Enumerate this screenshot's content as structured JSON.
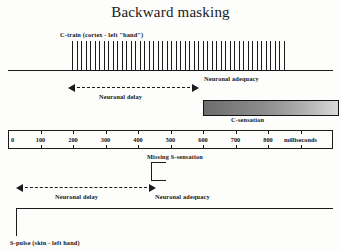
{
  "figure": {
    "title": "Backward masking",
    "width": 341,
    "height": 251,
    "background": "#fdfdfc",
    "ink": "#1b1b1b"
  },
  "labels": {
    "c_train": "C-train (cortex - left \"hand\")",
    "neuronal_adequacy_top": "Neuronal adequacy",
    "neuronal_delay_top": "Neuronal delay",
    "c_sensation": "C-sensation",
    "missing_s_sensation": "Missing S-sensation",
    "neuronal_delay_bottom": "Neuronal delay",
    "neuronal_adequacy_bottom": "Neuronal adequacy",
    "s_pulse": "S-pulse (skin - left hand)"
  },
  "axis": {
    "unit_label": "milliseconds",
    "ticks": [
      "0",
      "100",
      "200",
      "300",
      "400",
      "500",
      "600",
      "700",
      "800"
    ],
    "tick_values": [
      0,
      100,
      200,
      300,
      400,
      500,
      600,
      700,
      800
    ],
    "range_ms": [
      0,
      1000
    ],
    "unit_label_at_ms": 900,
    "minor_tick_count": 11
  },
  "chart_data": {
    "type": "timeline",
    "title": "Backward masking",
    "xlabel": "milliseconds",
    "xlim": [
      0,
      1000
    ],
    "xticks": [
      0,
      100,
      200,
      300,
      400,
      500,
      600,
      700,
      800
    ],
    "grid": false,
    "legend": "none",
    "series": [
      {
        "name": "C-train (cortex - left \"hand\")",
        "type": "pulse-train",
        "row": "top",
        "start_ms": 215,
        "end_ms": 915,
        "pulse_count": 48,
        "baseline_from_ms": -20,
        "baseline_to_ms": 1010
      },
      {
        "name": "Neuronal delay (cortical)",
        "type": "double-arrow",
        "row": "top",
        "start_ms": 200,
        "end_ms": 625
      },
      {
        "name": "Neuronal adequacy (cortical)",
        "type": "annotation",
        "row": "top",
        "at_ms": 640
      },
      {
        "name": "C-sensation",
        "type": "gradient-bar",
        "row": "top",
        "start_ms": 625,
        "end_ms": 1025,
        "gradient_from": "#6d6d6d",
        "gradient_to": "#d8d8d8"
      },
      {
        "name": "Missing S-sensation",
        "type": "bracket",
        "row": "bottom",
        "at_ms": 470
      },
      {
        "name": "Neuronal delay (skin)",
        "type": "double-arrow",
        "row": "bottom",
        "start_ms": 20,
        "end_ms": 470
      },
      {
        "name": "Neuronal adequacy (skin)",
        "type": "annotation",
        "row": "bottom",
        "at_ms": 480
      },
      {
        "name": "S-pulse (skin - left hand)",
        "type": "step",
        "row": "bottom",
        "onset_ms": 20,
        "end_ms": 1010
      }
    ]
  }
}
